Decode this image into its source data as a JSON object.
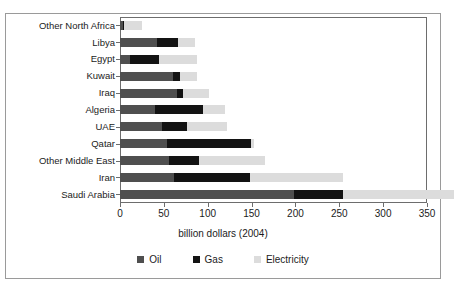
{
  "figure": {
    "clipped_header": "",
    "xlabel": "billion dollars (2004)"
  },
  "legend": {
    "items": [
      {
        "label": "Oil",
        "color": "#4f4f4f"
      },
      {
        "label": "Gas",
        "color": "#131313"
      },
      {
        "label": "Electricity",
        "color": "#dcdcdc"
      }
    ]
  },
  "chart_data": {
    "type": "bar",
    "orientation": "horizontal",
    "stacked": true,
    "title": "",
    "xlabel": "billion dollars (2004)",
    "ylabel": "",
    "xlim": [
      0,
      350
    ],
    "xticks": [
      0,
      50,
      100,
      150,
      200,
      250,
      300,
      350
    ],
    "xtick_labels": [
      "0",
      "50",
      "100",
      "150",
      "200",
      "250",
      "300",
      "350"
    ],
    "grid": false,
    "legend_position": "bottom",
    "categories": [
      "Other North Africa",
      "Libya",
      "Egypt",
      "Kuwait",
      "Iraq",
      "Algeria",
      "UAE",
      "Qatar",
      "Other Middle East",
      "Iran",
      "Saudi Arabia"
    ],
    "series": [
      {
        "name": "Oil",
        "color": "#4f4f4f",
        "values": [
          3,
          42,
          11,
          60,
          65,
          40,
          48,
          54,
          56,
          62,
          198
        ]
      },
      {
        "name": "Gas",
        "color": "#131313",
        "values": [
          2,
          24,
          34,
          8,
          7,
          55,
          28,
          95,
          34,
          86,
          56
        ]
      },
      {
        "name": "Electricity",
        "color": "#dcdcdc",
        "values": [
          20,
          19,
          43,
          20,
          30,
          25,
          46,
          4,
          75,
          106,
          127
        ]
      }
    ],
    "totals": [
      25,
      85,
      88,
      88,
      102,
      120,
      122,
      153,
      165,
      254,
      381
    ]
  }
}
